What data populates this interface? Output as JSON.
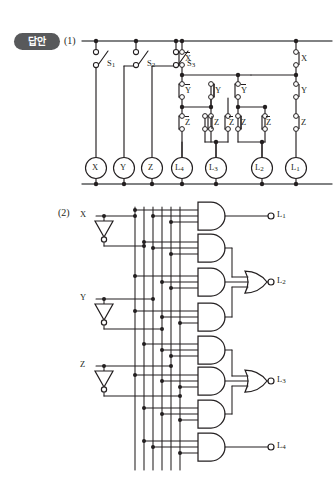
{
  "badge": {
    "label": "답안"
  },
  "sections": {
    "one": {
      "number": "(1)",
      "title": "relay-ladder-circuit"
    },
    "two": {
      "number": "(2)",
      "title": "logic-gate-circuit"
    }
  },
  "circuit1": {
    "switches": [
      {
        "name": "S1",
        "label": "S",
        "sub": "1",
        "x": 96
      },
      {
        "name": "S2",
        "label": "S",
        "sub": "2",
        "x": 136
      },
      {
        "name": "S3",
        "label": "S",
        "sub": "3",
        "x": 176
      }
    ],
    "contacts": [
      {
        "label": "X",
        "overline": true,
        "x": 176,
        "y": 60
      },
      {
        "label": "Y",
        "overline": true,
        "x": 176,
        "y": 92
      },
      {
        "label": "Z",
        "overline": true,
        "x": 176,
        "y": 124
      },
      {
        "label": "Z",
        "overline": false,
        "x": 205,
        "y": 124
      },
      {
        "label": "Y",
        "overline": false,
        "x": 205,
        "y": 92
      },
      {
        "label": "Z",
        "overline": true,
        "x": 232,
        "y": 124
      },
      {
        "label": "Z",
        "overline": false,
        "x": 258,
        "y": 124
      },
      {
        "label": "Y",
        "overline": true,
        "x": 232,
        "y": 92
      },
      {
        "label": "X",
        "overline": false,
        "x": 296,
        "y": 60
      },
      {
        "label": "Y",
        "overline": false,
        "x": 296,
        "y": 92
      },
      {
        "label": "Z",
        "overline": false,
        "x": 296,
        "y": 124
      },
      {
        "label": "Z",
        "overline": true,
        "x": 270,
        "y": 124
      }
    ],
    "loads": [
      {
        "label": "X",
        "sub": "",
        "x": 96
      },
      {
        "label": "Y",
        "sub": "",
        "x": 124
      },
      {
        "label": "Z",
        "sub": "",
        "x": 152
      },
      {
        "label": "L",
        "sub": "4",
        "x": 180
      },
      {
        "label": "L",
        "sub": "3",
        "x": 216
      },
      {
        "label": "L",
        "sub": "2",
        "x": 262
      },
      {
        "label": "L",
        "sub": "1",
        "x": 298
      }
    ],
    "rails": {
      "top_y": 41,
      "bottom_y": 184
    }
  },
  "circuit2": {
    "inputs": [
      {
        "label": "X",
        "x": 88,
        "y": 214
      },
      {
        "label": "Y",
        "x": 88,
        "y": 297
      },
      {
        "label": "Z",
        "x": 88,
        "y": 364
      }
    ],
    "inverters": [
      {
        "name": "not-x",
        "x": 104,
        "y": 224
      },
      {
        "name": "not-y",
        "x": 104,
        "y": 307
      },
      {
        "name": "not-z",
        "x": 104,
        "y": 374
      }
    ],
    "bus_lines": [
      135,
      144,
      153,
      162,
      171,
      180
    ],
    "bus_labels": [
      "X",
      "X'",
      "Y",
      "Y'",
      "Z",
      "Z'"
    ],
    "and_gates": [
      {
        "name": "and-1",
        "y": 216
      },
      {
        "name": "and-2",
        "y": 248
      },
      {
        "name": "and-3",
        "y": 282
      },
      {
        "name": "and-4",
        "y": 317
      },
      {
        "name": "and-5",
        "y": 350
      },
      {
        "name": "and-6",
        "y": 381
      },
      {
        "name": "and-7",
        "y": 414
      },
      {
        "name": "and-8",
        "y": 447
      }
    ],
    "or_gates": [
      {
        "name": "or-l2",
        "y": 282
      },
      {
        "name": "or-l3",
        "y": 381
      }
    ],
    "outputs": [
      {
        "label": "L",
        "sub": "1",
        "y": 216,
        "x": 277
      },
      {
        "label": "L",
        "sub": "2",
        "y": 282,
        "x": 277
      },
      {
        "label": "L",
        "sub": "3",
        "y": 381,
        "x": 277
      },
      {
        "label": "L",
        "sub": "4",
        "y": 447,
        "x": 277
      }
    ]
  },
  "colors": {
    "ink": "#231f20",
    "badge_bg": "#58595b",
    "rail": "#58595b"
  }
}
